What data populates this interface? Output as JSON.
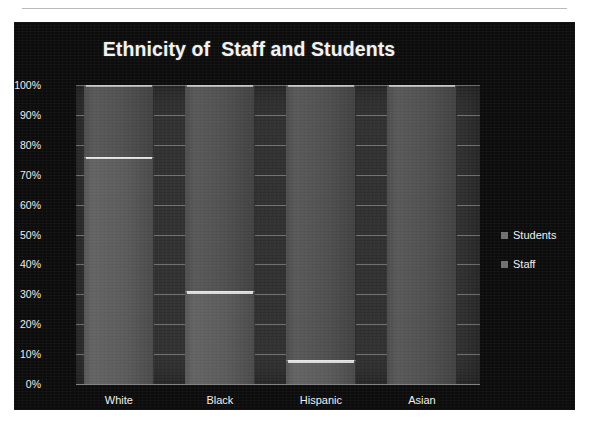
{
  "chart_data": {
    "type": "bar",
    "title": "Ethnicity of  Staff and Students",
    "xlabel": "",
    "ylabel": "",
    "ylim": [
      0,
      100
    ],
    "y_ticks": [
      "0%",
      "10%",
      "20%",
      "30%",
      "40%",
      "50%",
      "60%",
      "70%",
      "80%",
      "90%",
      "100%"
    ],
    "grid": true,
    "legend_position": "right",
    "categories": [
      "White",
      "Black",
      "Hispanic",
      "Asian"
    ],
    "series": [
      {
        "name": "Students",
        "color": "#4e4e4e",
        "values": [
          100,
          100,
          100,
          100
        ]
      },
      {
        "name": "Staff",
        "color": "#585858",
        "values": [
          76,
          31,
          8,
          0
        ]
      }
    ]
  },
  "legend": {
    "items": [
      {
        "label": "Students",
        "color": "#6f6f6f"
      },
      {
        "label": "Staff",
        "color": "#6f6f6f"
      }
    ]
  },
  "colors": {
    "chart_background": "#0c0c0c",
    "plot_background": "#2e2e2e",
    "text": "#efefef",
    "gridline": "#d2d2d2",
    "page_background": "#ffffff"
  }
}
